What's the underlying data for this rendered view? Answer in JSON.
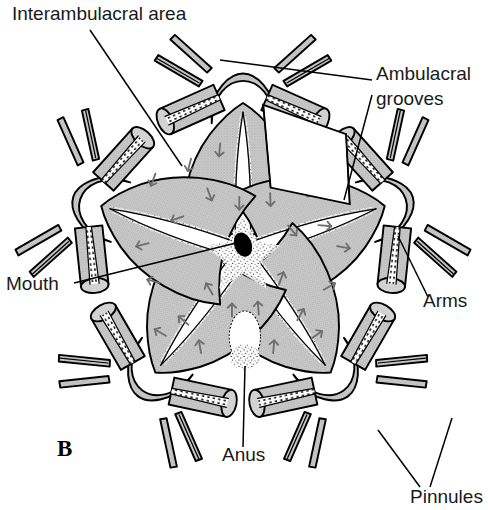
{
  "figure": {
    "panel_letter": "B",
    "colors": {
      "body_fill": "#c6c6c6",
      "groove_fill": "#ffffff",
      "outline": "#000000",
      "arrow": "#6e6e6e",
      "mouth_fill": "#000000",
      "background": "#ffffff"
    }
  },
  "labels": [
    {
      "id": "interambulacral-area",
      "text": "Interambulacral area",
      "x": 12,
      "y": 20,
      "anchor": "start"
    },
    {
      "id": "ambulacral-grooves-1",
      "text": "Ambulacral",
      "x": 376,
      "y": 80,
      "anchor": "start"
    },
    {
      "id": "ambulacral-grooves-2",
      "text": "grooves",
      "x": 376,
      "y": 105,
      "anchor": "start"
    },
    {
      "id": "mouth",
      "text": "Mouth",
      "x": 6,
      "y": 290,
      "anchor": "start"
    },
    {
      "id": "arms",
      "text": "Arms",
      "x": 423,
      "y": 307,
      "anchor": "start"
    },
    {
      "id": "anus",
      "text": "Anus",
      "x": 222,
      "y": 461,
      "anchor": "start"
    },
    {
      "id": "pinnules",
      "text": "Pinnules",
      "x": 410,
      "y": 503,
      "anchor": "start"
    }
  ],
  "structures": {
    "mouth": {
      "shape": "filled-oval",
      "cx": 243,
      "cy": 238,
      "rx": 9,
      "ry": 13,
      "rotation": -20
    },
    "anus": {
      "shape": "open-papilla-oval",
      "cx": 245,
      "cy": 337,
      "rx": 16,
      "ry": 27
    },
    "ray_count": 5,
    "arms_per_ray": 2,
    "cutaway_wedge": {
      "present": true,
      "describes": "ambulacral-grooves"
    }
  }
}
